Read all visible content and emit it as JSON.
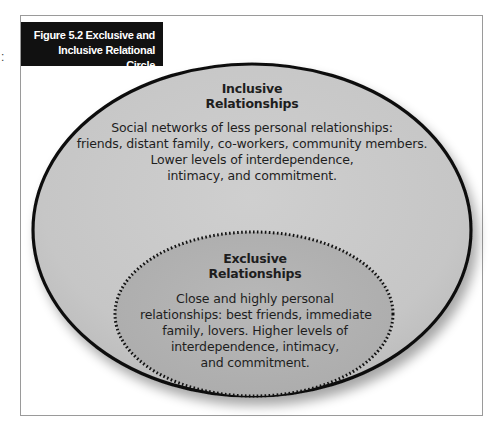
{
  "figure": {
    "title_lines": [
      "Figure 5.2  Exclusive and",
      "Inclusive Relational Circle"
    ],
    "edge_mark": ":"
  },
  "outer_circle": {
    "heading_lines": [
      "Inclusive",
      "Relationships"
    ],
    "body_lines": [
      "Social networks of less personal relationships:",
      "friends, distant family, co-workers, community members.",
      "Lower levels of interdependence,",
      "intimacy, and commitment."
    ],
    "fill_color": "#c9c9c9",
    "stroke_color": "#111111"
  },
  "inner_circle": {
    "heading_lines": [
      "Exclusive",
      "Relationships"
    ],
    "body_lines": [
      "Close and highly personal",
      "relationships: best friends, immediate",
      "family, lovers. Higher levels of",
      "interdependence, intimacy,",
      "and commitment."
    ],
    "fill_color": "#b3b3b3",
    "stroke_color": "#111111",
    "stroke_style": "dotted"
  },
  "colors": {
    "title_background": "#111111",
    "title_text": "#ffffff",
    "frame_border": "#9a9a9a",
    "text": "#1e1e1e"
  }
}
